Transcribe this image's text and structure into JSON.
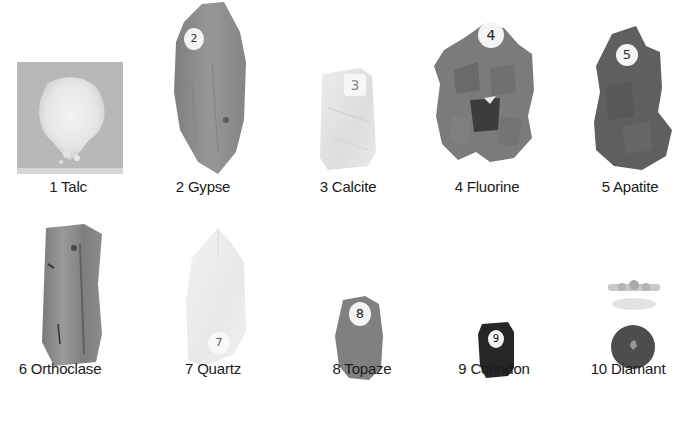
{
  "minerals": [
    {
      "number": "1",
      "name": "Talc",
      "label": "1 Talc",
      "tag": ""
    },
    {
      "number": "2",
      "name": "Gypse",
      "label": "2 Gypse",
      "tag": "2"
    },
    {
      "number": "3",
      "name": "Calcite",
      "label": "3 Calcite",
      "tag": "3"
    },
    {
      "number": "4",
      "name": "Fluorine",
      "label": "4 Fluorine",
      "tag": "4"
    },
    {
      "number": "5",
      "name": "Apatite",
      "label": "5 Apatite",
      "tag": "5"
    },
    {
      "number": "6",
      "name": "Orthoclase",
      "label": "6 Orthoclase",
      "tag": ""
    },
    {
      "number": "7",
      "name": "Quartz",
      "label": "7 Quartz",
      "tag": "7"
    },
    {
      "number": "8",
      "name": "Topaze",
      "label": "8 Topaze",
      "tag": "8"
    },
    {
      "number": "9",
      "name": "Corindon",
      "label": "9 Corindon",
      "tag": "9"
    },
    {
      "number": "10",
      "name": "Diamant",
      "label": "10 Diamant",
      "tag": ""
    }
  ],
  "colors": {
    "background": "#ffffff",
    "label_text": "#1a1a1a",
    "talc_card": "#b9b9b9",
    "talc_powder": "#ececec",
    "gypse": "#8e8e8e",
    "calcite": "#e6e6e6",
    "fluorine": "#7d7d7d",
    "apatite": "#5c5c5c",
    "orthoclase": "#8a8a8a",
    "quartz": "#ededed",
    "topaze": "#7f7f7f",
    "corindon": "#262626",
    "diamant_disc": "#4d4d4d"
  }
}
